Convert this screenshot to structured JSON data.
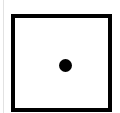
{
  "die": {
    "face_value": "1",
    "pip_count": 1,
    "border_color": "#000000",
    "pip_color": "#000000",
    "face_color": "#ffffff"
  }
}
